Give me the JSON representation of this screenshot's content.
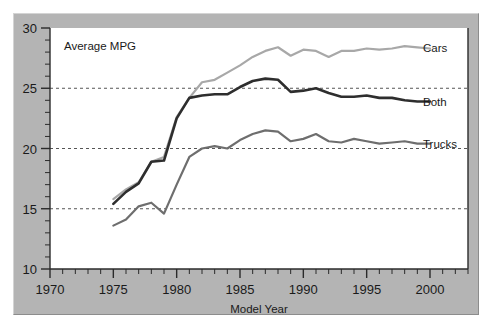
{
  "chart_data": {
    "type": "line",
    "title": "",
    "inner_note": "Average MPG",
    "xlabel": "Model Year",
    "ylabel": "",
    "xlim": [
      1970,
      2003
    ],
    "ylim": [
      10,
      30
    ],
    "xticks": [
      1970,
      1975,
      1980,
      1985,
      1990,
      1995,
      2000
    ],
    "xtick_labels": [
      "1970",
      "1975",
      "1980",
      "1985",
      "1990",
      "1995",
      "2000"
    ],
    "yticks": [
      10,
      15,
      20,
      25,
      30
    ],
    "ytick_labels": [
      "10",
      "15",
      "20",
      "25",
      "30"
    ],
    "minor_xtick_step": 1,
    "minor_ytick_step": 1,
    "grid": "horizontal-dashed-at-15-20-25",
    "legend_position": "inline-right-of-line-ends",
    "x": [
      1975,
      1976,
      1977,
      1978,
      1979,
      1980,
      1981,
      1982,
      1983,
      1984,
      1985,
      1986,
      1987,
      1988,
      1989,
      1990,
      1991,
      1992,
      1993,
      1994,
      1995,
      1996,
      1997,
      1998,
      1999,
      2000
    ],
    "series": [
      {
        "name": "Cars",
        "label": "Cars",
        "color": "#a8a8a8",
        "values": [
          15.8,
          16.6,
          17.2,
          18.9,
          19.3,
          22.6,
          24.2,
          25.5,
          25.7,
          26.3,
          26.9,
          27.6,
          28.1,
          28.4,
          27.7,
          28.2,
          28.1,
          27.6,
          28.1,
          28.1,
          28.3,
          28.2,
          28.3,
          28.5,
          28.4,
          28.3
        ]
      },
      {
        "name": "Both",
        "label": "Both",
        "color": "#2e2e2e",
        "values": [
          15.4,
          16.4,
          17.1,
          18.9,
          19.0,
          22.5,
          24.2,
          24.4,
          24.5,
          24.5,
          25.1,
          25.6,
          25.8,
          25.7,
          24.7,
          24.8,
          25.0,
          24.6,
          24.3,
          24.3,
          24.4,
          24.2,
          24.2,
          24.0,
          23.9,
          23.9
        ]
      },
      {
        "name": "Trucks",
        "label": "Trucks",
        "color": "#6e6e6e",
        "values": [
          13.6,
          14.1,
          15.2,
          15.5,
          14.6,
          17.0,
          19.3,
          20.0,
          20.2,
          20.0,
          20.7,
          21.2,
          21.5,
          21.4,
          20.6,
          20.8,
          21.2,
          20.6,
          20.5,
          20.8,
          20.6,
          20.4,
          20.5,
          20.6,
          20.4,
          20.4
        ]
      }
    ]
  },
  "axes": {
    "y_labels": [
      "30",
      "25",
      "20",
      "15",
      "10"
    ],
    "x_labels": [
      "1970",
      "1975",
      "1980",
      "1985",
      "1990",
      "1995",
      "2000"
    ],
    "x_axis_title": "Model Year",
    "plot_note": "Average MPG"
  },
  "colors": {
    "panel_background": "#b4b4b4",
    "plot_background": "#ffffff",
    "cars": "#a8a8a8",
    "both": "#2e2e2e",
    "trucks": "#6e6e6e",
    "gridline": "#555555",
    "text": "#1a1a1a"
  }
}
